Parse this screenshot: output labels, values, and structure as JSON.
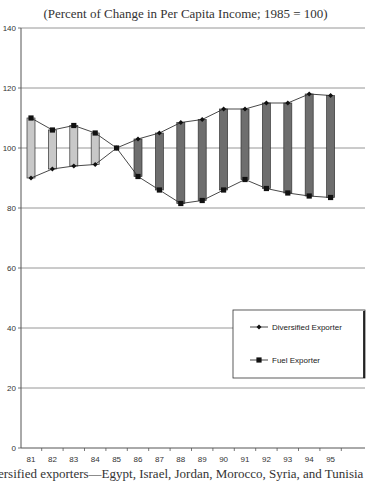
{
  "chart_data": {
    "type": "line",
    "subtitle": "(Percent of Change in Per Capita Income; 1985 = 100)",
    "xlabel": "",
    "ylabel": "",
    "categories": [
      "81",
      "82",
      "83",
      "84",
      "85",
      "86",
      "87",
      "88",
      "89",
      "90",
      "91",
      "92",
      "93",
      "94",
      "95"
    ],
    "y_ticks": [
      0,
      20,
      40,
      60,
      80,
      100,
      120,
      140
    ],
    "ylim": [
      0,
      140
    ],
    "grid": "horizontal",
    "legend_position": "lower right inside plot",
    "series": [
      {
        "name": "Diversified Exporter",
        "marker": "diamond",
        "values": [
          90,
          93,
          94,
          94.5,
          100,
          103,
          105,
          108.5,
          109.5,
          113,
          113,
          115,
          115,
          118,
          117.5
        ]
      },
      {
        "name": "Fuel Exporter",
        "marker": "square",
        "values": [
          110,
          106,
          107.5,
          105,
          100,
          90.5,
          86,
          81.5,
          82.5,
          86,
          89.5,
          86.5,
          85,
          84,
          83.5
        ]
      }
    ],
    "bars": {
      "description": "high-low bars connecting the two series each year",
      "color_before_1985": "#c8c8c8",
      "color_after_1985": "#6e6e6e"
    }
  },
  "caption_partial": "ersified exporters—Egypt, Israel, Jordan, Morocco, Syria, and Tunisia"
}
